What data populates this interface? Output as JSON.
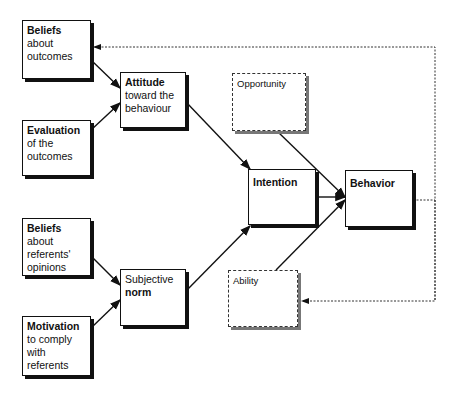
{
  "diagram": {
    "nodes": {
      "beliefs_outcomes": {
        "bold": "Beliefs",
        "rest": [
          "about",
          "outcomes"
        ]
      },
      "evaluation": {
        "bold": "Evaluation",
        "rest": [
          "of the",
          "outcomes"
        ]
      },
      "attitude": {
        "bold": "Attitude",
        "rest": [
          "toward the",
          "behaviour"
        ]
      },
      "beliefs_referents": {
        "bold": "Beliefs",
        "rest": [
          "about",
          "referents'",
          "opinions"
        ]
      },
      "motivation": {
        "bold": "Motivation",
        "rest": [
          "to comply",
          "with",
          "referents"
        ]
      },
      "subjective_norm": {
        "pre": "Subjective",
        "bold": "norm"
      },
      "opportunity": {
        "label": "Opportunity"
      },
      "intention": {
        "bold": "Intention"
      },
      "behavior": {
        "bold": "Behavior"
      },
      "ability": {
        "label": "Ability"
      }
    },
    "edges": [
      [
        "beliefs_outcomes",
        "attitude"
      ],
      [
        "evaluation",
        "attitude"
      ],
      [
        "beliefs_referents",
        "subjective_norm"
      ],
      [
        "motivation",
        "subjective_norm"
      ],
      [
        "attitude",
        "intention"
      ],
      [
        "subjective_norm",
        "intention"
      ],
      [
        "intention",
        "behavior"
      ],
      [
        "opportunity",
        "behavior"
      ],
      [
        "ability",
        "behavior"
      ],
      [
        "behavior",
        "beliefs_outcomes",
        "dotted-feedback"
      ],
      [
        "behavior",
        "ability",
        "dotted-feedback"
      ]
    ]
  }
}
